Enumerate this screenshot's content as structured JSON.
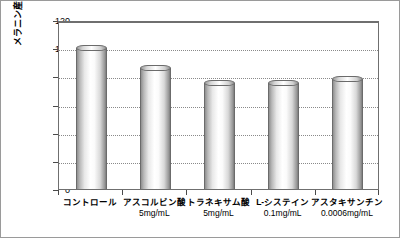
{
  "chart_data": {
    "type": "bar",
    "title": "",
    "subtitle": "",
    "xlabel": "",
    "ylabel": "メラニン産生率(%)",
    "ylim": [
      0,
      120
    ],
    "yticks": [
      "0",
      "20",
      "40",
      "60",
      "80",
      "100",
      "120"
    ],
    "grid": true,
    "legend": null,
    "categories": [
      "コントロール",
      "アスコルビン酸",
      "トラネキサム酸",
      "L-システイン",
      "アスタキサンチン"
    ],
    "category_units": [
      "",
      "5mg/mL",
      "5mg/mL",
      "0.1mg/mL",
      "0.0006mg/mL"
    ],
    "values": [
      100,
      86,
      75,
      75,
      78
    ],
    "bars": [
      {
        "label": "コントロール",
        "unit": "",
        "value": 100
      },
      {
        "label": "アスコルビン酸",
        "unit": "5mg/mL",
        "value": 86
      },
      {
        "label": "トラネキサム酸",
        "unit": "5mg/mL",
        "value": 75
      },
      {
        "label": "L-システイン",
        "unit": "0.1mg/mL",
        "value": 75
      },
      {
        "label": "アスタキサンチン",
        "unit": "0.0006mg/mL",
        "value": 78
      }
    ],
    "colors": {
      "bar_light": "#ffffff",
      "bar_dark": "#8f8f8f",
      "axis": "#6f6f6f",
      "grid": "#8a8a8a",
      "text": "#000000",
      "background": "#ffffff"
    }
  }
}
